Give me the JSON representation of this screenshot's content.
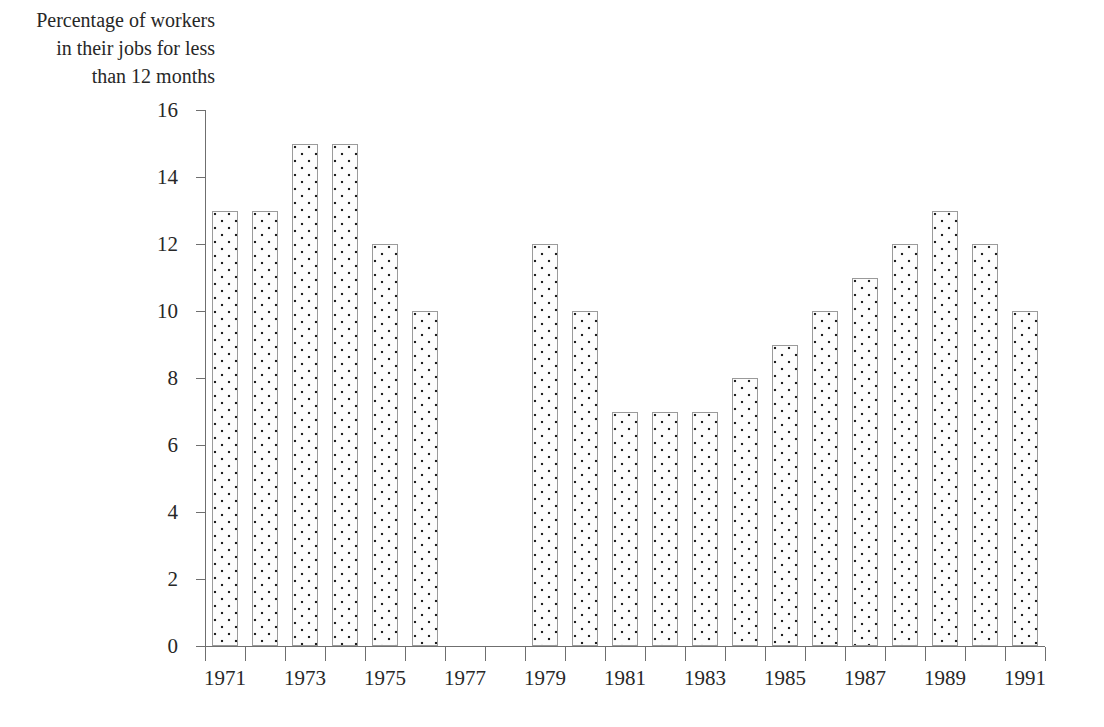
{
  "chart_data": {
    "type": "bar",
    "title": "",
    "ylabel": "Percentage of workers\nin their jobs for less\nthan 12 months",
    "xlabel": "",
    "ylim": [
      0,
      16
    ],
    "y_ticks": [
      0,
      2,
      4,
      6,
      8,
      10,
      12,
      14,
      16
    ],
    "y_tick_labels": [
      "0",
      "2",
      "4",
      "6",
      "8",
      "10",
      "12",
      "14",
      "16"
    ],
    "categories": [
      "1971",
      "1972",
      "1973",
      "1974",
      "1975",
      "1976",
      "1977",
      "1978",
      "1979",
      "1980",
      "1981",
      "1982",
      "1983",
      "1984",
      "1985",
      "1986",
      "1987",
      "1988",
      "1989",
      "1990",
      "1991"
    ],
    "x_tick_labels": [
      "1971",
      "1973",
      "1975",
      "1977",
      "1979",
      "1981",
      "1983",
      "1985",
      "1987",
      "1989",
      "1991"
    ],
    "values": [
      13,
      13,
      15,
      15,
      12,
      10,
      null,
      null,
      12,
      10,
      7,
      7,
      7,
      8,
      9,
      10,
      11,
      12,
      13,
      12,
      10
    ],
    "missing_years": [
      "1977",
      "1978"
    ],
    "grid": false,
    "legend": "none",
    "bar_fill": "dotted-stipple",
    "bar_edge_color": "#9a9a9a",
    "axis_color": "#6f6f6f",
    "background_color": "#ffffff"
  }
}
